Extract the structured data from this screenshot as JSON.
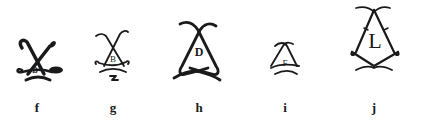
{
  "figures": [
    {
      "caption": "f",
      "letter": "B"
    },
    {
      "caption": "g",
      "letter": "B"
    },
    {
      "caption": "h",
      "letter": "D"
    },
    {
      "caption": "i",
      "letter": "F"
    },
    {
      "caption": "j",
      "letter": "L"
    }
  ],
  "colors": {
    "ink": "#1a1a1a",
    "background": "#ffffff"
  }
}
